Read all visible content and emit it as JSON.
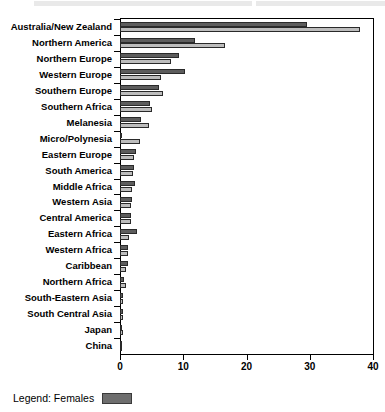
{
  "top_strip": {
    "present": true,
    "color": "#e9e9e9"
  },
  "legend": {
    "label": "Legend: Females",
    "swatch_color": "#6e6e6e"
  },
  "colors": {
    "series_males": "#5d5d5d",
    "series_females": "#bdbdbd",
    "axis": "#000000",
    "background": "#ffffff"
  },
  "chart_data": {
    "type": "bar",
    "orientation": "horizontal",
    "title": "",
    "xlabel": "",
    "ylabel": "",
    "xlim": [
      0,
      40
    ],
    "xticks": [
      0,
      10,
      20,
      30,
      40
    ],
    "xtick_labels": [
      "0",
      "10",
      "20",
      "30",
      "40"
    ],
    "grid": false,
    "legend_position": "below-plot-left",
    "categories": [
      "Australia/New Zealand",
      "Northern America",
      "Northern Europe",
      "Western Europe",
      "Southern Europe",
      "Southern Africa",
      "Melanesia",
      "Micro/Polynesia",
      "Eastern Europe",
      "South America",
      "Middle Africa",
      "Western Asia",
      "Central America",
      "Eastern Africa",
      "Western Africa",
      "Caribbean",
      "Northern Africa",
      "South-Eastern Asia",
      "South Central Asia",
      "Japan",
      "China"
    ],
    "series": [
      {
        "name": "Males",
        "color": "#5d5d5d",
        "values": [
          29.6,
          11.8,
          9.4,
          10.3,
          6.1,
          4.7,
          3.3,
          0.3,
          2.6,
          2.2,
          2.3,
          1.9,
          1.8,
          2.7,
          1.3,
          1.2,
          0.7,
          0.4,
          0.4,
          0.3,
          0.2
        ]
      },
      {
        "name": "Females",
        "color": "#bdbdbd",
        "values": [
          37.9,
          16.6,
          8.0,
          6.5,
          6.8,
          5.0,
          4.6,
          3.2,
          2.2,
          2.1,
          1.9,
          1.7,
          1.7,
          1.4,
          1.2,
          1.0,
          0.9,
          0.5,
          0.5,
          0.4,
          0.2
        ]
      }
    ]
  }
}
